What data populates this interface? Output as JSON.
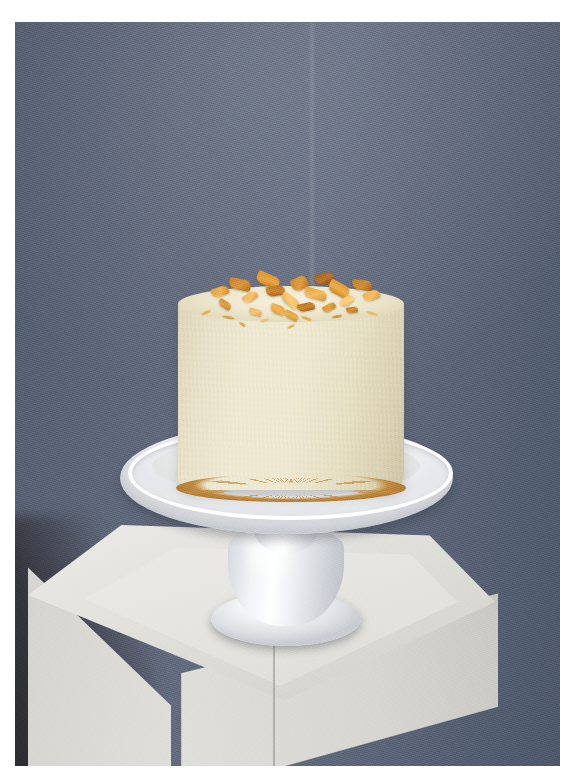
{
  "image": {
    "kind": "photograph",
    "subject": "Frosted layer cake topped with golden honeycomb toffee shards on a white pedestal cake stand",
    "orientation": "portrait",
    "width_px": 575,
    "height_px": 783,
    "border": {
      "style": "white photo print border",
      "color": "#ffffff",
      "top_px": 22,
      "left_px": 15,
      "right_px": 15,
      "bottom_px": 17
    }
  },
  "scene": {
    "backdrop": {
      "name": "slate blue-grey studio backdrop",
      "color": "#5d6678",
      "color_light": "#646d80",
      "color_dark": "#4e576b",
      "has_vertical_crease": true
    },
    "shadow": {
      "name": "dark shadow wedge lower-left",
      "color": "#2a2a30"
    },
    "plinth": {
      "name": "white square display plinth",
      "color_top": "#ecebe6",
      "color_face_left": "#dddcd7",
      "color_face_right": "#d7d6d1",
      "has_inset_seam": true
    },
    "cake_stand": {
      "name": "white ceramic pedestal cake stand",
      "color": "#ffffff",
      "parts": [
        "plate",
        "rim",
        "stem",
        "base"
      ]
    },
    "cake": {
      "name": "round layer cake",
      "frosting": "cream buttercream",
      "frosting_color": "#efe9d2",
      "frosting_color_shadow": "#cdc3a2",
      "base_crumb_color": "#c08a3d",
      "topping_name": "honeycomb toffee shards",
      "topping_color": "#d9922f",
      "topping_color_light": "#f0b95c",
      "topping_color_dark": "#a86318"
    }
  },
  "topping_shards": [
    {
      "x": 2,
      "y": 16,
      "w": 18,
      "h": 9,
      "rot": -18,
      "c": "#e0a13b"
    },
    {
      "x": 12,
      "y": 8,
      "w": 22,
      "h": 11,
      "rot": 12,
      "c": "#c8832a"
    },
    {
      "x": 20,
      "y": 22,
      "w": 16,
      "h": 8,
      "rot": -32,
      "c": "#eeb258"
    },
    {
      "x": 28,
      "y": 3,
      "w": 24,
      "h": 12,
      "rot": 24,
      "c": "#d9922f"
    },
    {
      "x": 34,
      "y": 15,
      "w": 19,
      "h": 10,
      "rot": -9,
      "c": "#b87423"
    },
    {
      "x": 42,
      "y": 25,
      "w": 21,
      "h": 9,
      "rot": 38,
      "c": "#f0bb63"
    },
    {
      "x": 48,
      "y": 6,
      "w": 17,
      "h": 13,
      "rot": -26,
      "c": "#cd8a2d"
    },
    {
      "x": 56,
      "y": 18,
      "w": 23,
      "h": 10,
      "rot": 15,
      "c": "#e5a848"
    },
    {
      "x": 62,
      "y": 2,
      "w": 19,
      "h": 11,
      "rot": -14,
      "c": "#a86318"
    },
    {
      "x": 70,
      "y": 12,
      "w": 22,
      "h": 12,
      "rot": 29,
      "c": "#dd9b37"
    },
    {
      "x": 76,
      "y": 26,
      "w": 15,
      "h": 8,
      "rot": -40,
      "c": "#f2c06e"
    },
    {
      "x": 84,
      "y": 9,
      "w": 20,
      "h": 10,
      "rot": 7,
      "c": "#c07d27"
    },
    {
      "x": 90,
      "y": 20,
      "w": 17,
      "h": 9,
      "rot": -21,
      "c": "#e9ad4f"
    },
    {
      "x": 6,
      "y": 30,
      "w": 14,
      "h": 7,
      "rot": 33,
      "c": "#cf8f33"
    },
    {
      "x": 52,
      "y": 32,
      "w": 18,
      "h": 8,
      "rot": -12,
      "c": "#b9761f"
    },
    {
      "x": 36,
      "y": 34,
      "w": 16,
      "h": 9,
      "rot": 20,
      "c": "#e3a441"
    },
    {
      "x": 66,
      "y": 33,
      "w": 14,
      "h": 7,
      "rot": -30,
      "c": "#d4932f"
    },
    {
      "x": 24,
      "y": 38,
      "w": 13,
      "h": 6,
      "rot": 16,
      "c": "#edb25b"
    },
    {
      "x": 80,
      "y": 36,
      "w": 12,
      "h": 6,
      "rot": -8,
      "c": "#c3801f"
    },
    {
      "x": 44,
      "y": 41,
      "w": 15,
      "h": 7,
      "rot": 27,
      "c": "#dba03c"
    }
  ],
  "topping_drizzles": [
    {
      "x": -4,
      "y": 40,
      "w": 10,
      "h": 3,
      "rot": -24,
      "c": "#e3a93f"
    },
    {
      "x": 8,
      "y": 45,
      "w": 13,
      "h": 3,
      "rot": 12,
      "c": "#d2962f"
    },
    {
      "x": 30,
      "y": 48,
      "w": 9,
      "h": 3,
      "rot": -15,
      "c": "#efba5e"
    },
    {
      "x": 54,
      "y": 46,
      "w": 11,
      "h": 3,
      "rot": 20,
      "c": "#dfa33c"
    },
    {
      "x": 72,
      "y": 44,
      "w": 10,
      "h": 3,
      "rot": -10,
      "c": "#c98a28"
    },
    {
      "x": 92,
      "y": 41,
      "w": 12,
      "h": 3,
      "rot": 18,
      "c": "#e9b152"
    },
    {
      "x": 18,
      "y": 52,
      "w": 7,
      "h": 3,
      "rot": 34,
      "c": "#d9972f"
    },
    {
      "x": 46,
      "y": 54,
      "w": 8,
      "h": 3,
      "rot": -28,
      "c": "#e5ab48"
    }
  ]
}
